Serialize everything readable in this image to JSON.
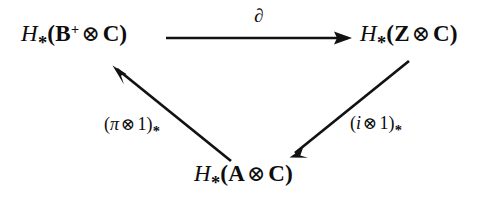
{
  "diagram": {
    "type": "commutative-triangle",
    "background_color": "#ffffff",
    "ink_color": "#121212",
    "nodes": [
      {
        "id": "top-left",
        "position": "top-left",
        "latex": "H_*(\\mathbf{B}^+ \\otimes \\mathbf{C})",
        "plain": "H_*(B+ ⊗ C)",
        "functor": "H",
        "subscript": "*",
        "first_factor": "B",
        "first_factor_superscript": "+",
        "operator": "⊗",
        "second_factor": "C"
      },
      {
        "id": "top-right",
        "position": "top-right",
        "latex": "H_*(\\mathbf{Z} \\otimes \\mathbf{C})",
        "plain": "H_*(Z ⊗ C)",
        "functor": "H",
        "subscript": "*",
        "first_factor": "Z",
        "first_factor_superscript": "",
        "operator": "⊗",
        "second_factor": "C"
      },
      {
        "id": "bottom",
        "position": "bottom-center",
        "latex": "H_*(\\mathbf{A} \\otimes \\mathbf{C})",
        "plain": "H_*(A ⊗ C)",
        "functor": "H",
        "subscript": "*",
        "first_factor": "A",
        "first_factor_superscript": "",
        "operator": "⊗",
        "second_factor": "C"
      }
    ],
    "edges": [
      {
        "id": "boundary-map",
        "from": "top-left",
        "to": "top-right",
        "direction": "right",
        "label": "∂",
        "label_latex": "\\partial",
        "label_position": "above"
      },
      {
        "id": "pi-tensor-1",
        "from": "bottom",
        "to": "top-left",
        "direction": "up-left",
        "label_parts": {
          "open": "(",
          "map": "π",
          "operator": "⊗",
          "identity": "1",
          "close": ")",
          "subscript": "*"
        },
        "label_latex": "(\\pi \\otimes 1)_*",
        "label_plain": "(π ⊗ 1)_*",
        "label_position": "left"
      },
      {
        "id": "i-tensor-1",
        "from": "top-right",
        "to": "bottom",
        "direction": "down-left",
        "label_parts": {
          "open": "(",
          "map": "i",
          "operator": "⊗",
          "identity": "1",
          "close": ")",
          "subscript": "*"
        },
        "label_latex": "(i \\otimes 1)_*",
        "label_plain": "(i ⊗ 1)_*",
        "label_position": "right"
      }
    ],
    "glyphs": {
      "tensor": "⊗",
      "star": "*",
      "plus": "+",
      "partial": "∂",
      "pi": "π",
      "lparen": "(",
      "rparen": ")"
    }
  }
}
